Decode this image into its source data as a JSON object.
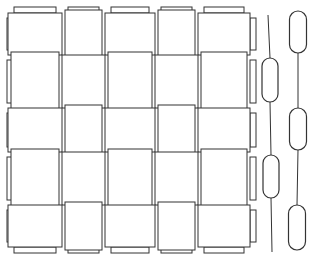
{
  "diagram": {
    "grid_rows": 5,
    "grid_cols": 5,
    "pattern": "plain-weave",
    "line_color": "#333333",
    "background": "#ffffff",
    "cross_sections": [
      {
        "name": "warp-cross-section-a",
        "floats": 2,
        "phase": "low"
      },
      {
        "name": "warp-cross-section-b",
        "floats": 3,
        "phase": "high"
      }
    ]
  }
}
